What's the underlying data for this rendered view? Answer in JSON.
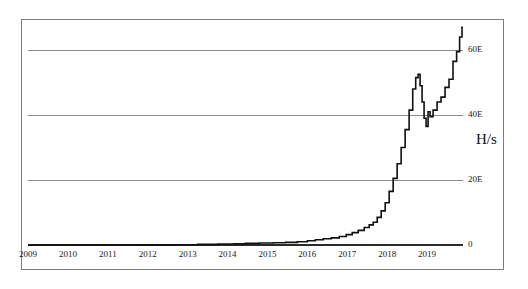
{
  "figure": {
    "unit_label": "H/s",
    "frame_color": "#7d7d7d",
    "gridline_color": "#8a8a8a",
    "series_color": "#101010",
    "background": "#ffffff"
  },
  "chart_data": {
    "type": "line",
    "title": "",
    "subtitle": "",
    "xlabel": "",
    "ylabel": "H/s",
    "grid": true,
    "legend": "none",
    "xlim": [
      2009,
      2019.9
    ],
    "ylim": [
      0,
      68
    ],
    "y_tick_labels": [
      "0",
      "20E",
      "40E",
      "60E"
    ],
    "y_tick_values": [
      0,
      20,
      40,
      60
    ],
    "x_tick_labels": [
      "2009",
      "2010",
      "2011",
      "2012",
      "2013",
      "2014",
      "2015",
      "2016",
      "2017",
      "2018",
      "2019"
    ],
    "x_tick_values": [
      2009,
      2010,
      2011,
      2012,
      2013,
      2014,
      2015,
      2016,
      2017,
      2018,
      2019
    ],
    "series": [
      {
        "name": "Bitcoin network hashrate",
        "unit": "EH/s",
        "x": [
          2009.0,
          2009.5,
          2010.0,
          2010.5,
          2011.0,
          2011.5,
          2012.0,
          2012.5,
          2013.0,
          2013.5,
          2014.0,
          2014.3,
          2014.6,
          2015.0,
          2015.3,
          2015.6,
          2015.9,
          2016.1,
          2016.3,
          2016.5,
          2016.7,
          2016.9,
          2017.05,
          2017.2,
          2017.35,
          2017.5,
          2017.6,
          2017.7,
          2017.8,
          2017.9,
          2018.0,
          2018.1,
          2018.2,
          2018.3,
          2018.4,
          2018.5,
          2018.6,
          2018.68,
          2018.75,
          2018.8,
          2018.85,
          2018.9,
          2018.95,
          2019.0,
          2019.05,
          2019.1,
          2019.2,
          2019.3,
          2019.4,
          2019.5,
          2019.6,
          2019.7,
          2019.78,
          2019.85,
          2019.9
        ],
        "y": [
          0.0,
          0.0,
          0.0,
          0.0,
          0.01,
          0.02,
          0.03,
          0.05,
          0.1,
          0.2,
          0.3,
          0.4,
          0.5,
          0.6,
          0.7,
          0.8,
          1.0,
          1.3,
          1.6,
          1.9,
          2.2,
          2.6,
          3.2,
          3.8,
          4.5,
          5.4,
          6.2,
          7.0,
          8.5,
          10.5,
          13.0,
          16.5,
          20.5,
          25.0,
          30.0,
          35.5,
          41.5,
          48.0,
          51.5,
          52.5,
          49.0,
          44.0,
          39.0,
          36.5,
          41.0,
          39.5,
          41.5,
          44.0,
          45.5,
          48.5,
          51.0,
          56.5,
          59.5,
          64.0,
          67.0
        ],
        "notable_points": {
          "first_rise_year": 2016,
          "local_peak": {
            "x": 2018.8,
            "y": 52.5
          },
          "local_trough": {
            "x": 2018.95,
            "y": 36.5
          },
          "final_value": {
            "x": 2019.9,
            "y": 67.0
          }
        }
      }
    ]
  }
}
